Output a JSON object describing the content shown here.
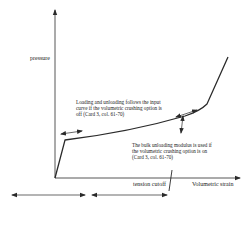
{
  "diagram": {
    "colors": {
      "line": "#2a2a2a",
      "text": "#222222",
      "background": "#ffffff"
    },
    "axes": {
      "y_label": "pressure",
      "x_label": "Volumetric strain"
    },
    "annotations": {
      "loading_note": "Loading and unloading follows the input curve if the volumetric crushing option is off (Card 3, col. 61-70)",
      "unloading_note": "The bulk unloading modulus is used if the volumetric crushing option is on (Card 3, col. 61-70)",
      "tension_cutoff": "tension cutoff"
    },
    "curve_points": [
      [
        55,
        178
      ],
      [
        65,
        140
      ],
      [
        100,
        133
      ],
      [
        140,
        125
      ],
      [
        180,
        117
      ],
      [
        205,
        108
      ],
      [
        228,
        57
      ]
    ],
    "arrows": [
      {
        "name": "loading-double-arrow",
        "from": [
          61,
          134
        ],
        "to": [
          82,
          131
        ]
      },
      {
        "name": "curve-double-arrow",
        "from": [
          176,
          117
        ],
        "to": [
          197,
          110
        ]
      },
      {
        "name": "unloading-vertical-arrow",
        "from": [
          183,
          117
        ],
        "to": [
          181,
          133
        ]
      },
      {
        "name": "bottom-left-double-arrow",
        "from": [
          12,
          195
        ],
        "to": [
          85,
          195
        ]
      },
      {
        "name": "tension-cutoff-double-arrow",
        "from": [
          92,
          195
        ],
        "to": [
          167,
          195
        ]
      }
    ]
  }
}
